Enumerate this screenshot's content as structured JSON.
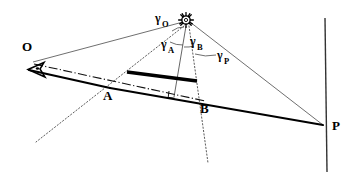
{
  "figure": {
    "background_color": "#ffffff",
    "stroke_color": "#000000",
    "thin_stroke_color": "#555555",
    "width": 348,
    "height": 177
  },
  "labels": {
    "observer_O": "O",
    "point_A": "A",
    "point_B": "B",
    "point_P": "P",
    "gamma_O_base": "γ",
    "gamma_O_sub": "O",
    "gamma_A_base": "γ",
    "gamma_A_sub": "A",
    "gamma_B_base": "γ",
    "gamma_B_sub": "B",
    "gamma_P_base": "γ",
    "gamma_P_sub": "P"
  },
  "elements": {
    "sun_icon": "sun-icon",
    "eye_icon": "eye-arrow-icon",
    "right_angle_marker": "right-angle-icon",
    "horizon_line": "dash-dot",
    "ray_style": "thin-solid",
    "projection_style": "dotted",
    "object_bar_style": "thick-solid",
    "vertical_screen_style": "thin-solid"
  },
  "geometry": {
    "sun": {
      "x": 186,
      "y": 20
    },
    "observer_O": {
      "x": 30,
      "y": 64
    },
    "point_A": {
      "x": 107,
      "y": 88
    },
    "point_B": {
      "x": 202,
      "y": 100
    },
    "point_P": {
      "x": 322,
      "y": 125
    },
    "bar_left": {
      "x": 127,
      "y": 72
    },
    "bar_right": {
      "x": 196,
      "y": 81
    },
    "vertical_line_top": {
      "x": 325,
      "y": 18
    },
    "vertical_line_bottom": {
      "x": 327,
      "y": 172
    },
    "foot_of_perpendicular": {
      "x": 174,
      "y": 97
    },
    "dotted_A_end": {
      "x": 36,
      "y": 142
    },
    "dotted_B_end": {
      "x": 208,
      "y": 163
    }
  }
}
